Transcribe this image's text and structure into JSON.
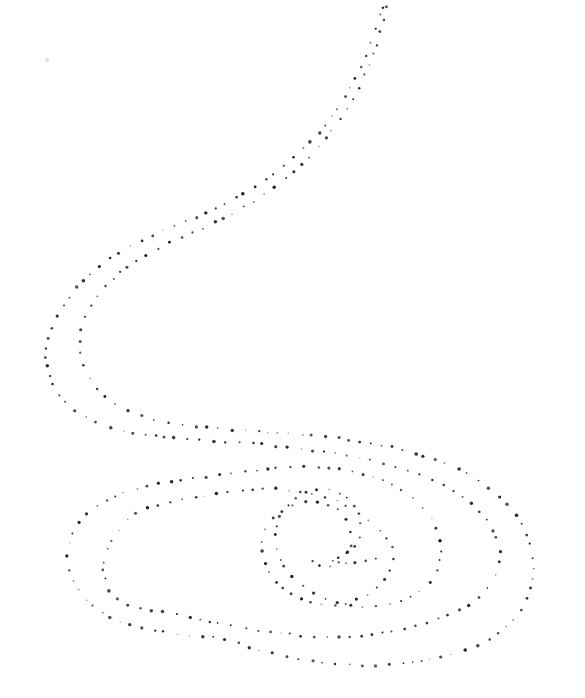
{
  "figure": {
    "background_color": "#ffffff",
    "dot_color": "#1b1b1b",
    "canvas": {
      "width": 585,
      "height": 698
    },
    "dot_spacing_px": 10.5,
    "dot_radius_range": [
      0.8,
      1.8
    ],
    "strokes": [
      {
        "name": "outer-stroke",
        "points": [
          [
            386,
            -10
          ],
          [
            381,
            12
          ],
          [
            374,
            34
          ],
          [
            365,
            57
          ],
          [
            355,
            79
          ],
          [
            343,
            100
          ],
          [
            330,
            119
          ],
          [
            316,
            136
          ],
          [
            300,
            152
          ],
          [
            283,
            167
          ],
          [
            265,
            180
          ],
          [
            246,
            192
          ],
          [
            226,
            203
          ],
          [
            205,
            213
          ],
          [
            184,
            222
          ],
          [
            162,
            231
          ],
          [
            141,
            241
          ],
          [
            120,
            252
          ],
          [
            101,
            265
          ],
          [
            84,
            280
          ],
          [
            69,
            297
          ],
          [
            57,
            316
          ],
          [
            49,
            336
          ],
          [
            46,
            357
          ],
          [
            50,
            378
          ],
          [
            59,
            396
          ],
          [
            74,
            410
          ],
          [
            93,
            421
          ],
          [
            115,
            429
          ],
          [
            140,
            434
          ],
          [
            168,
            437
          ],
          [
            197,
            440
          ],
          [
            228,
            442
          ],
          [
            260,
            444
          ],
          [
            292,
            448
          ],
          [
            324,
            452
          ],
          [
            355,
            457
          ],
          [
            385,
            464
          ],
          [
            413,
            472
          ],
          [
            439,
            483
          ],
          [
            461,
            496
          ],
          [
            479,
            512
          ],
          [
            492,
            529
          ],
          [
            499,
            547
          ],
          [
            499,
            565
          ],
          [
            492,
            582
          ],
          [
            479,
            597
          ],
          [
            461,
            609
          ],
          [
            438,
            619
          ],
          [
            411,
            627
          ],
          [
            381,
            633
          ],
          [
            350,
            637
          ],
          [
            318,
            637
          ],
          [
            287,
            634
          ],
          [
            257,
            630
          ],
          [
            227,
            625
          ],
          [
            200,
            620
          ],
          [
            175,
            614
          ],
          [
            152,
            610
          ],
          [
            133,
            607
          ],
          [
            118,
            599
          ],
          [
            108,
            588
          ],
          [
            104,
            575
          ],
          [
            104,
            562
          ],
          [
            108,
            549
          ],
          [
            114,
            537
          ],
          [
            122,
            526
          ],
          [
            132,
            516
          ],
          [
            145,
            509
          ],
          [
            160,
            505
          ],
          [
            177,
            501
          ],
          [
            195,
            497
          ],
          [
            214,
            494
          ],
          [
            234,
            491
          ],
          [
            255,
            489
          ],
          [
            277,
            489
          ],
          [
            299,
            492
          ],
          [
            321,
            496
          ],
          [
            341,
            503
          ],
          [
            359,
            513
          ],
          [
            376,
            527
          ],
          [
            388,
            540
          ],
          [
            394,
            554
          ],
          [
            391,
            569
          ],
          [
            381,
            583
          ],
          [
            366,
            595
          ],
          [
            347,
            603
          ],
          [
            326,
            605
          ],
          [
            306,
            601
          ],
          [
            288,
            592
          ],
          [
            274,
            579
          ],
          [
            265,
            563
          ],
          [
            262,
            547
          ],
          [
            265,
            531
          ],
          [
            274,
            517
          ],
          [
            288,
            507
          ],
          [
            305,
            502
          ],
          [
            322,
            503
          ],
          [
            337,
            510
          ],
          [
            347,
            522
          ],
          [
            351,
            536
          ],
          [
            349,
            550
          ],
          [
            341,
            561
          ],
          [
            329,
            567
          ],
          [
            317,
            564
          ],
          [
            309,
            556
          ]
        ]
      },
      {
        "name": "inner-stroke",
        "points": [
          [
            390,
            -10
          ],
          [
            386,
            12
          ],
          [
            380,
            34
          ],
          [
            372,
            57
          ],
          [
            363,
            79
          ],
          [
            352,
            100
          ],
          [
            340,
            119
          ],
          [
            327,
            137
          ],
          [
            313,
            153
          ],
          [
            298,
            168
          ],
          [
            281,
            182
          ],
          [
            263,
            195
          ],
          [
            244,
            207
          ],
          [
            224,
            218
          ],
          [
            203,
            228
          ],
          [
            182,
            237
          ],
          [
            161,
            247
          ],
          [
            141,
            258
          ],
          [
            122,
            271
          ],
          [
            106,
            286
          ],
          [
            93,
            303
          ],
          [
            84,
            321
          ],
          [
            80,
            340
          ],
          [
            82,
            359
          ],
          [
            89,
            377
          ],
          [
            101,
            393
          ],
          [
            118,
            406
          ],
          [
            139,
            415
          ],
          [
            163,
            422
          ],
          [
            190,
            426
          ],
          [
            219,
            429
          ],
          [
            250,
            431
          ],
          [
            282,
            433
          ],
          [
            314,
            436
          ],
          [
            345,
            439
          ],
          [
            375,
            444
          ],
          [
            404,
            450
          ],
          [
            431,
            458
          ],
          [
            457,
            468
          ],
          [
            480,
            481
          ],
          [
            500,
            497
          ],
          [
            516,
            515
          ],
          [
            527,
            535
          ],
          [
            533,
            556
          ],
          [
            533,
            578
          ],
          [
            527,
            599
          ],
          [
            515,
            618
          ],
          [
            497,
            634
          ],
          [
            474,
            647
          ],
          [
            447,
            656
          ],
          [
            417,
            662
          ],
          [
            385,
            665
          ],
          [
            352,
            665
          ],
          [
            318,
            662
          ],
          [
            284,
            656
          ],
          [
            250,
            647
          ],
          [
            218,
            638
          ],
          [
            190,
            636
          ],
          [
            165,
            632
          ],
          [
            143,
            628
          ],
          [
            122,
            622
          ],
          [
            102,
            612
          ],
          [
            87,
            600
          ],
          [
            75,
            585
          ],
          [
            69,
            570
          ],
          [
            67,
            556
          ],
          [
            70,
            540
          ],
          [
            77,
            526
          ],
          [
            87,
            513
          ],
          [
            101,
            503
          ],
          [
            118,
            495
          ],
          [
            137,
            489
          ],
          [
            158,
            484
          ],
          [
            180,
            480
          ],
          [
            203,
            477
          ],
          [
            226,
            474
          ],
          [
            249,
            471
          ],
          [
            271,
            468
          ],
          [
            293,
            467
          ],
          [
            315,
            467
          ],
          [
            337,
            469
          ],
          [
            358,
            473
          ],
          [
            378,
            479
          ],
          [
            397,
            488
          ],
          [
            414,
            499
          ],
          [
            428,
            513
          ],
          [
            437,
            529
          ],
          [
            441,
            546
          ],
          [
            439,
            563
          ],
          [
            432,
            579
          ],
          [
            419,
            592
          ],
          [
            402,
            601
          ],
          [
            382,
            606
          ],
          [
            360,
            607
          ],
          [
            338,
            603
          ],
          [
            317,
            595
          ],
          [
            299,
            583
          ],
          [
            285,
            568
          ],
          [
            277,
            551
          ],
          [
            275,
            534
          ],
          [
            279,
            518
          ],
          [
            288,
            505
          ],
          [
            301,
            495
          ],
          [
            317,
            490
          ],
          [
            333,
            491
          ],
          [
            347,
            498
          ],
          [
            357,
            510
          ],
          [
            361,
            525
          ],
          [
            359,
            539
          ],
          [
            351,
            550
          ],
          [
            339,
            557
          ],
          [
            329,
            560
          ],
          [
            341,
            563
          ],
          [
            355,
            562
          ],
          [
            369,
            560
          ],
          [
            382,
            558
          ]
        ]
      }
    ],
    "stray_marks": [
      {
        "x": 47,
        "y": 60,
        "radius": 2.2,
        "opacity": 0.12
      }
    ]
  }
}
